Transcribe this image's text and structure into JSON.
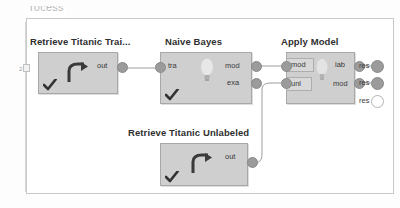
{
  "panel": {
    "group_title": "rocess"
  },
  "canvas": {
    "left_ruler_tick": "2"
  },
  "nodes": [
    {
      "id": "retrieve-titanic-training",
      "title": "Retrieve Titanic Trai...",
      "icon": "retrieve-arrow-icon",
      "status_icon": "check-icon",
      "inputs": [],
      "outputs": [
        "out"
      ]
    },
    {
      "id": "naive-bayes",
      "title": "Naive Bayes",
      "icon": "bulb-icon",
      "status_icon": "check-icon",
      "inputs": [
        "tra"
      ],
      "outputs": [
        "mod",
        "exa"
      ]
    },
    {
      "id": "apply-model",
      "title": "Apply Model",
      "icon": "bulb-icon",
      "status_icon": "",
      "inputs": [
        "mod",
        "unl"
      ],
      "outputs": [
        "lab",
        "mod"
      ]
    },
    {
      "id": "retrieve-titanic-unlabeled",
      "title": "Retrieve Titanic Unlabeled",
      "icon": "retrieve-arrow-icon",
      "status_icon": "check-icon",
      "inputs": [],
      "outputs": [
        "out"
      ]
    }
  ],
  "result_ports": [
    {
      "label": "res",
      "connected": true
    },
    {
      "label": "res",
      "connected": true
    },
    {
      "label": "res",
      "connected": false
    }
  ],
  "colors": {
    "node_fill": "#cfcfcf",
    "node_border": "#a8a8a8",
    "port_fill": "#9b9b9b",
    "wire": "#9d9d9d",
    "title_text": "#2f2f2f",
    "frame_border": "#c9c9c9",
    "canvas_bg": "#ffffff"
  }
}
